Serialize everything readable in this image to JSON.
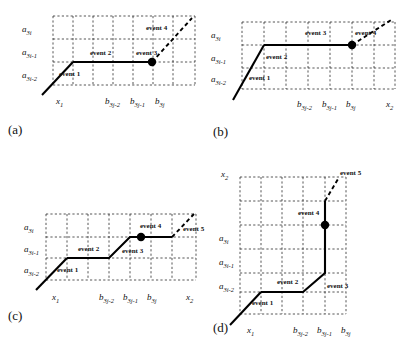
{
  "figure": {
    "type": "four-panel-staircase-path-diagram",
    "axis_labels": {
      "y_top": "a",
      "y_top_sub": "3i",
      "y_mid": "a",
      "y_mid_sub": "3i-1",
      "y_bot": "a",
      "y_bot_sub": "3i-2",
      "x_start": "x",
      "x_start_sub": "1",
      "x_b1": "b",
      "x_b1_sub": "3j-2",
      "x_b2": "b",
      "x_b2_sub": "3j-1",
      "x_b3": "b",
      "x_b3_sub": "3j",
      "x_end": "x",
      "x_end_sub": "2"
    },
    "panels": [
      {
        "id": "a",
        "label": "(a)",
        "grid": {
          "cols": 7,
          "rows": 3
        },
        "y_axis_labels": [
          "a3i",
          "a3i-1",
          "a3i-2"
        ],
        "x_axis_labels": [
          "x1",
          "b3j-2",
          "b3j-1",
          "b3j"
        ],
        "events": [
          "event 1",
          "event 2",
          "event 3",
          "event 4"
        ],
        "has_end_dot": true,
        "end_label": "x2_absent"
      },
      {
        "id": "b",
        "label": "(b)",
        "grid": {
          "cols": 7,
          "rows": 3
        },
        "y_axis_labels": [
          "a3i",
          "a3i-1",
          "a3i-2"
        ],
        "x_axis_labels": [
          "x1",
          "b3j-2",
          "b3j-1",
          "b3j",
          "x2"
        ],
        "events": [
          "event 1",
          "event 2",
          "event 3",
          "event 4"
        ],
        "has_end_dot": true
      },
      {
        "id": "c",
        "label": "(c)",
        "grid": {
          "cols": 7,
          "rows": 3
        },
        "y_axis_labels": [
          "a3i",
          "a3i-1",
          "a3i-2"
        ],
        "x_axis_labels": [
          "x1",
          "b3j-2",
          "b3j-1",
          "b3j",
          "x2"
        ],
        "events": [
          "event 1",
          "event 2",
          "event 3",
          "event 4",
          "event 5"
        ],
        "has_end_dot": true
      },
      {
        "id": "d",
        "label": "(d)",
        "grid": {
          "cols": 5,
          "rows": 6
        },
        "y_axis_labels": [
          "x2",
          "a3i",
          "a3i-1",
          "a3i-2"
        ],
        "x_axis_labels": [
          "x1",
          "b3j-2",
          "b3j-1",
          "b3j"
        ],
        "events": [
          "event 1",
          "event 2",
          "event 3",
          "event 4",
          "event 5"
        ],
        "has_end_dot": true
      }
    ],
    "event_labels": {
      "e1": "event 1",
      "e2": "event 2",
      "e3": "event 3",
      "e4": "event 4",
      "e5": "event 5"
    },
    "colors": {
      "grid": "#2b2b2b",
      "path": "#000000",
      "background": "#ffffff"
    }
  }
}
